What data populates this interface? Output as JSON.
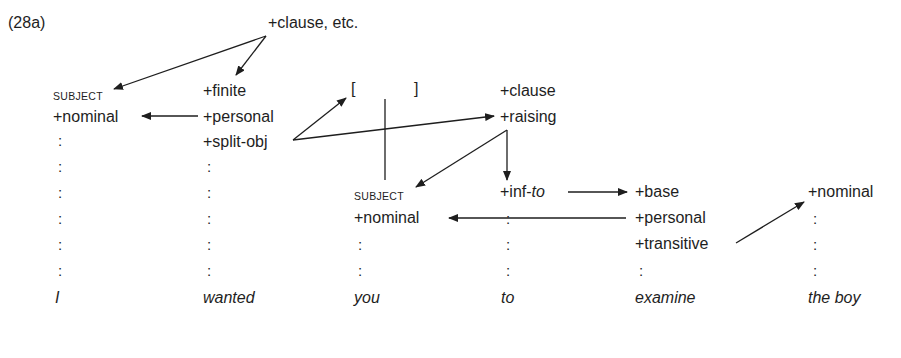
{
  "example_label": "(28a)",
  "root": "+clause, etc.",
  "columns": [
    {
      "word": "I",
      "features": [
        "SUBJECT",
        "+nominal"
      ]
    },
    {
      "word": "wanted",
      "features": [
        "+finite",
        "+personal",
        "+split-obj"
      ]
    },
    {
      "word": "you",
      "bracket_open": "[",
      "bracket_close": "]",
      "features": [
        "SUBJECT",
        "+nominal"
      ]
    },
    {
      "word": "to",
      "features": [
        "+clause",
        "+raising",
        "+inf-",
        "to"
      ]
    },
    {
      "word": "examine",
      "features": [
        "+base",
        "+personal",
        "+transitive"
      ]
    },
    {
      "word": "the boy",
      "features": [
        "+nominal"
      ]
    }
  ],
  "continuation_mark": ":",
  "arrows": [
    {
      "from": "+clause, etc.",
      "to": "SUBJECT (I)"
    },
    {
      "from": "+clause, etc.",
      "to": "+finite"
    },
    {
      "from": "+personal (wanted)",
      "to": "+nominal (I)"
    },
    {
      "from": "+split-obj",
      "to": "[ ] bracket"
    },
    {
      "from": "+split-obj",
      "to": "+raising"
    },
    {
      "from": "+raising",
      "to": "SUBJECT (you)"
    },
    {
      "from": "+raising",
      "to": "+inf-to"
    },
    {
      "from": "+inf-to",
      "to": "+base"
    },
    {
      "from": "+personal (examine)",
      "to": "+nominal (you)"
    },
    {
      "from": "+transitive",
      "to": "+nominal (the boy)"
    }
  ]
}
